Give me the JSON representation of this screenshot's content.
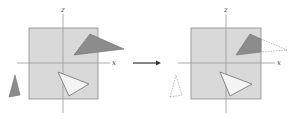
{
  "diagram": {
    "colors": {
      "viewport_fill": "#d9d9d9",
      "viewport_stroke": "#8a8a8a",
      "axis": "#9a9a9a",
      "dark_triangle": "#8c8c8c",
      "light_triangle": "#f4f4f4",
      "triangle_stroke": "#6e6e6e",
      "arrow": "#333333"
    },
    "before": {
      "axis_z_label": "z",
      "axis_x_label": "x"
    },
    "after": {
      "axis_z_label": "z",
      "axis_x_label": "x"
    },
    "arrow": {
      "direction": "right"
    }
  }
}
